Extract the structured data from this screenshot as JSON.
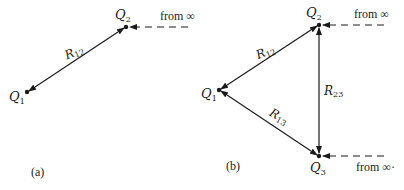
{
  "panels": [
    {
      "id": "a",
      "caption": "(a)",
      "charges": [
        {
          "name": "Q",
          "sub": "1",
          "x": 27,
          "y": 92
        },
        {
          "name": "Q",
          "sub": "2",
          "x": 126,
          "y": 27
        }
      ],
      "distances": [
        {
          "name": "R",
          "sub": "12",
          "from": "Q1",
          "to": "Q2",
          "arrows": "both"
        }
      ],
      "incoming": [
        {
          "label": "from",
          "symbol": "∞",
          "target": "Q2"
        }
      ]
    },
    {
      "id": "b",
      "caption": "(b)",
      "charges": [
        {
          "name": "Q",
          "sub": "1",
          "x": 219,
          "y": 90
        },
        {
          "name": "Q",
          "sub": "2",
          "x": 319,
          "y": 25
        },
        {
          "name": "Q",
          "sub": "3",
          "x": 319,
          "y": 156
        }
      ],
      "distances": [
        {
          "name": "R",
          "sub": "12",
          "from": "Q1",
          "to": "Q2",
          "arrows": "both"
        },
        {
          "name": "R",
          "sub": "13",
          "from": "Q1",
          "to": "Q3",
          "arrows": "both"
        },
        {
          "name": "R",
          "sub": "23",
          "from": "Q2",
          "to": "Q3",
          "arrows": "both"
        }
      ],
      "incoming": [
        {
          "label": "from",
          "symbol": "∞",
          "target": "Q2"
        },
        {
          "label": "from",
          "symbol": "∞·",
          "target": "Q3"
        }
      ]
    }
  ],
  "colors": {
    "ink": "#1a1a1a",
    "background": "#ffffff"
  }
}
